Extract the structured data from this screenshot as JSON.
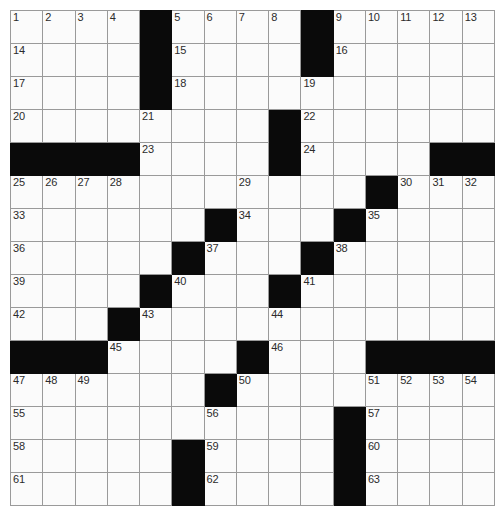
{
  "puzzle": {
    "title": "Crossword Grid",
    "columns": 14,
    "rows": 15,
    "cell_size_px": 34,
    "colors": {
      "block": "#0a0a0a",
      "cell_background": "#fbfbfb",
      "grid_line": "#9a9a9a",
      "outer_border": "#4a4a4a",
      "number_text": "#2b2b2b"
    },
    "block_count": 42,
    "numbered_cell_count": 63,
    "max_clue_number": 63,
    "grid": [
      [
        {
          "type": "cell",
          "number": "1"
        },
        {
          "type": "cell",
          "number": "2"
        },
        {
          "type": "cell",
          "number": "3"
        },
        {
          "type": "cell",
          "number": "4"
        },
        {
          "type": "block",
          "number": ""
        },
        {
          "type": "cell",
          "number": "5"
        },
        {
          "type": "cell",
          "number": "6"
        },
        {
          "type": "cell",
          "number": "7"
        },
        {
          "type": "cell",
          "number": "8"
        },
        {
          "type": "block",
          "number": ""
        },
        {
          "type": "cell",
          "number": "9"
        },
        {
          "type": "cell",
          "number": "10"
        },
        {
          "type": "cell",
          "number": "11"
        },
        {
          "type": "cell",
          "number": "12"
        },
        {
          "type": "cell",
          "number": "13"
        }
      ],
      [
        {
          "type": "cell",
          "number": "14"
        },
        {
          "type": "cell",
          "number": ""
        },
        {
          "type": "cell",
          "number": ""
        },
        {
          "type": "cell",
          "number": ""
        },
        {
          "type": "block",
          "number": ""
        },
        {
          "type": "cell",
          "number": "15"
        },
        {
          "type": "cell",
          "number": ""
        },
        {
          "type": "cell",
          "number": ""
        },
        {
          "type": "cell",
          "number": ""
        },
        {
          "type": "block",
          "number": ""
        },
        {
          "type": "cell",
          "number": "16"
        },
        {
          "type": "cell",
          "number": ""
        },
        {
          "type": "cell",
          "number": ""
        },
        {
          "type": "cell",
          "number": ""
        },
        {
          "type": "cell",
          "number": ""
        }
      ],
      [
        {
          "type": "cell",
          "number": "17"
        },
        {
          "type": "cell",
          "number": ""
        },
        {
          "type": "cell",
          "number": ""
        },
        {
          "type": "cell",
          "number": ""
        },
        {
          "type": "block",
          "number": ""
        },
        {
          "type": "cell",
          "number": "18"
        },
        {
          "type": "cell",
          "number": ""
        },
        {
          "type": "cell",
          "number": ""
        },
        {
          "type": "cell",
          "number": ""
        },
        {
          "type": "cell",
          "number": "19"
        },
        {
          "type": "cell",
          "number": ""
        },
        {
          "type": "cell",
          "number": ""
        },
        {
          "type": "cell",
          "number": ""
        },
        {
          "type": "cell",
          "number": ""
        },
        {
          "type": "cell",
          "number": ""
        }
      ],
      [
        {
          "type": "cell",
          "number": "20"
        },
        {
          "type": "cell",
          "number": ""
        },
        {
          "type": "cell",
          "number": ""
        },
        {
          "type": "cell",
          "number": ""
        },
        {
          "type": "cell",
          "number": "21"
        },
        {
          "type": "cell",
          "number": ""
        },
        {
          "type": "cell",
          "number": ""
        },
        {
          "type": "cell",
          "number": ""
        },
        {
          "type": "block",
          "number": ""
        },
        {
          "type": "cell",
          "number": "22"
        },
        {
          "type": "cell",
          "number": ""
        },
        {
          "type": "cell",
          "number": ""
        },
        {
          "type": "cell",
          "number": ""
        },
        {
          "type": "cell",
          "number": ""
        },
        {
          "type": "cell",
          "number": ""
        }
      ],
      [
        {
          "type": "block",
          "number": ""
        },
        {
          "type": "block",
          "number": ""
        },
        {
          "type": "block",
          "number": ""
        },
        {
          "type": "block",
          "number": ""
        },
        {
          "type": "cell",
          "number": "23"
        },
        {
          "type": "cell",
          "number": ""
        },
        {
          "type": "cell",
          "number": ""
        },
        {
          "type": "cell",
          "number": ""
        },
        {
          "type": "block",
          "number": ""
        },
        {
          "type": "cell",
          "number": "24"
        },
        {
          "type": "cell",
          "number": ""
        },
        {
          "type": "cell",
          "number": ""
        },
        {
          "type": "cell",
          "number": ""
        },
        {
          "type": "block",
          "number": ""
        },
        {
          "type": "block",
          "number": ""
        }
      ],
      [
        {
          "type": "cell",
          "number": "25"
        },
        {
          "type": "cell",
          "number": "26"
        },
        {
          "type": "cell",
          "number": "27"
        },
        {
          "type": "cell",
          "number": "28"
        },
        {
          "type": "cell",
          "number": ""
        },
        {
          "type": "cell",
          "number": ""
        },
        {
          "type": "cell",
          "number": ""
        },
        {
          "type": "cell",
          "number": "29"
        },
        {
          "type": "cell",
          "number": ""
        },
        {
          "type": "cell",
          "number": ""
        },
        {
          "type": "cell",
          "number": ""
        },
        {
          "type": "block",
          "number": ""
        },
        {
          "type": "cell",
          "number": "30"
        },
        {
          "type": "cell",
          "number": "31"
        },
        {
          "type": "cell",
          "number": "32"
        }
      ],
      [
        {
          "type": "cell",
          "number": "33"
        },
        {
          "type": "cell",
          "number": ""
        },
        {
          "type": "cell",
          "number": ""
        },
        {
          "type": "cell",
          "number": ""
        },
        {
          "type": "cell",
          "number": ""
        },
        {
          "type": "cell",
          "number": ""
        },
        {
          "type": "block",
          "number": ""
        },
        {
          "type": "cell",
          "number": "34"
        },
        {
          "type": "cell",
          "number": ""
        },
        {
          "type": "cell",
          "number": ""
        },
        {
          "type": "block",
          "number": ""
        },
        {
          "type": "cell",
          "number": "35"
        },
        {
          "type": "cell",
          "number": ""
        },
        {
          "type": "cell",
          "number": ""
        },
        {
          "type": "cell",
          "number": ""
        }
      ],
      [
        {
          "type": "cell",
          "number": "36"
        },
        {
          "type": "cell",
          "number": ""
        },
        {
          "type": "cell",
          "number": ""
        },
        {
          "type": "cell",
          "number": ""
        },
        {
          "type": "cell",
          "number": ""
        },
        {
          "type": "block",
          "number": ""
        },
        {
          "type": "cell",
          "number": "37"
        },
        {
          "type": "cell",
          "number": ""
        },
        {
          "type": "cell",
          "number": ""
        },
        {
          "type": "block",
          "number": ""
        },
        {
          "type": "cell",
          "number": "38"
        },
        {
          "type": "cell",
          "number": ""
        },
        {
          "type": "cell",
          "number": ""
        },
        {
          "type": "cell",
          "number": ""
        },
        {
          "type": "cell",
          "number": ""
        }
      ],
      [
        {
          "type": "cell",
          "number": "39"
        },
        {
          "type": "cell",
          "number": ""
        },
        {
          "type": "cell",
          "number": ""
        },
        {
          "type": "cell",
          "number": ""
        },
        {
          "type": "block",
          "number": ""
        },
        {
          "type": "cell",
          "number": "40"
        },
        {
          "type": "cell",
          "number": ""
        },
        {
          "type": "cell",
          "number": ""
        },
        {
          "type": "block",
          "number": ""
        },
        {
          "type": "cell",
          "number": "41"
        },
        {
          "type": "cell",
          "number": ""
        },
        {
          "type": "cell",
          "number": ""
        },
        {
          "type": "cell",
          "number": ""
        },
        {
          "type": "cell",
          "number": ""
        },
        {
          "type": "cell",
          "number": ""
        }
      ],
      [
        {
          "type": "cell",
          "number": "42"
        },
        {
          "type": "cell",
          "number": ""
        },
        {
          "type": "cell",
          "number": ""
        },
        {
          "type": "block",
          "number": ""
        },
        {
          "type": "cell",
          "number": "43"
        },
        {
          "type": "cell",
          "number": ""
        },
        {
          "type": "cell",
          "number": ""
        },
        {
          "type": "cell",
          "number": ""
        },
        {
          "type": "cell",
          "number": "44"
        },
        {
          "type": "cell",
          "number": ""
        },
        {
          "type": "cell",
          "number": ""
        },
        {
          "type": "cell",
          "number": ""
        },
        {
          "type": "cell",
          "number": ""
        },
        {
          "type": "cell",
          "number": ""
        },
        {
          "type": "cell",
          "number": ""
        }
      ],
      [
        {
          "type": "block",
          "number": ""
        },
        {
          "type": "block",
          "number": ""
        },
        {
          "type": "block",
          "number": ""
        },
        {
          "type": "cell",
          "number": "45"
        },
        {
          "type": "cell",
          "number": ""
        },
        {
          "type": "cell",
          "number": ""
        },
        {
          "type": "cell",
          "number": ""
        },
        {
          "type": "block",
          "number": ""
        },
        {
          "type": "cell",
          "number": "46"
        },
        {
          "type": "cell",
          "number": ""
        },
        {
          "type": "cell",
          "number": ""
        },
        {
          "type": "block",
          "number": ""
        },
        {
          "type": "block",
          "number": ""
        },
        {
          "type": "block",
          "number": ""
        },
        {
          "type": "block",
          "number": ""
        }
      ],
      [
        {
          "type": "cell",
          "number": "47"
        },
        {
          "type": "cell",
          "number": "48"
        },
        {
          "type": "cell",
          "number": "49"
        },
        {
          "type": "cell",
          "number": ""
        },
        {
          "type": "cell",
          "number": ""
        },
        {
          "type": "cell",
          "number": ""
        },
        {
          "type": "block",
          "number": ""
        },
        {
          "type": "cell",
          "number": "50"
        },
        {
          "type": "cell",
          "number": ""
        },
        {
          "type": "cell",
          "number": ""
        },
        {
          "type": "cell",
          "number": ""
        },
        {
          "type": "cell",
          "number": "51"
        },
        {
          "type": "cell",
          "number": "52"
        },
        {
          "type": "cell",
          "number": "53"
        },
        {
          "type": "cell",
          "number": "54"
        }
      ],
      [
        {
          "type": "cell",
          "number": "55"
        },
        {
          "type": "cell",
          "number": ""
        },
        {
          "type": "cell",
          "number": ""
        },
        {
          "type": "cell",
          "number": ""
        },
        {
          "type": "cell",
          "number": ""
        },
        {
          "type": "cell",
          "number": ""
        },
        {
          "type": "cell",
          "number": "56"
        },
        {
          "type": "cell",
          "number": ""
        },
        {
          "type": "cell",
          "number": ""
        },
        {
          "type": "cell",
          "number": ""
        },
        {
          "type": "block",
          "number": ""
        },
        {
          "type": "cell",
          "number": "57"
        },
        {
          "type": "cell",
          "number": ""
        },
        {
          "type": "cell",
          "number": ""
        },
        {
          "type": "cell",
          "number": ""
        }
      ],
      [
        {
          "type": "cell",
          "number": "58"
        },
        {
          "type": "cell",
          "number": ""
        },
        {
          "type": "cell",
          "number": ""
        },
        {
          "type": "cell",
          "number": ""
        },
        {
          "type": "cell",
          "number": ""
        },
        {
          "type": "block",
          "number": ""
        },
        {
          "type": "cell",
          "number": "59"
        },
        {
          "type": "cell",
          "number": ""
        },
        {
          "type": "cell",
          "number": ""
        },
        {
          "type": "cell",
          "number": ""
        },
        {
          "type": "block",
          "number": ""
        },
        {
          "type": "cell",
          "number": "60"
        },
        {
          "type": "cell",
          "number": ""
        },
        {
          "type": "cell",
          "number": ""
        },
        {
          "type": "cell",
          "number": ""
        }
      ],
      [
        {
          "type": "cell",
          "number": "61"
        },
        {
          "type": "cell",
          "number": ""
        },
        {
          "type": "cell",
          "number": ""
        },
        {
          "type": "cell",
          "number": ""
        },
        {
          "type": "cell",
          "number": ""
        },
        {
          "type": "block",
          "number": ""
        },
        {
          "type": "cell",
          "number": "62"
        },
        {
          "type": "cell",
          "number": ""
        },
        {
          "type": "cell",
          "number": ""
        },
        {
          "type": "cell",
          "number": ""
        },
        {
          "type": "block",
          "number": ""
        },
        {
          "type": "cell",
          "number": "63"
        },
        {
          "type": "cell",
          "number": ""
        },
        {
          "type": "cell",
          "number": ""
        },
        {
          "type": "cell",
          "number": ""
        }
      ]
    ]
  }
}
